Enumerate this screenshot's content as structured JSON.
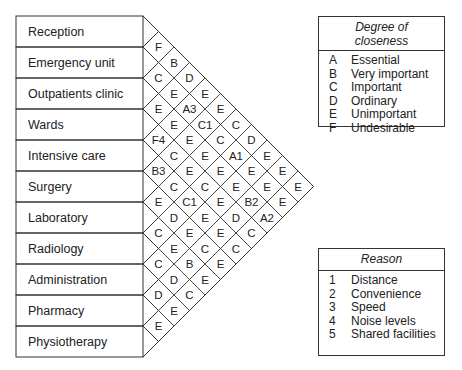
{
  "departments": [
    "Reception",
    "Emergency unit",
    "Outpatients clinic",
    "Wards",
    "Intensive care",
    "Surgery",
    "Laboratory",
    "Radiology",
    "Administration",
    "Pharmacy",
    "Physiotherapy"
  ],
  "matrix": [
    [
      "F",
      "B",
      "D",
      "E",
      "E",
      "C",
      "D",
      "E",
      "E",
      "E"
    ],
    [
      "C",
      "E",
      "A3",
      "C1",
      "C",
      "A1",
      "E",
      "E",
      "E"
    ],
    [
      "E",
      "E",
      "E",
      "E",
      "E",
      "E",
      "B2",
      "A2"
    ],
    [
      "F4",
      "C",
      "E",
      "C",
      "E",
      "D",
      "C"
    ],
    [
      "B3",
      "C",
      "C1",
      "E",
      "E",
      "C"
    ],
    [
      "E",
      "D",
      "E",
      "C",
      "E"
    ],
    [
      "C",
      "E",
      "B",
      "E"
    ],
    [
      "C",
      "D",
      "C"
    ],
    [
      "D",
      "E"
    ],
    [
      "E"
    ]
  ],
  "closeness_legend": {
    "title": "Degree of closeness",
    "title_line1": "Degree of",
    "title_line2": "closeness",
    "items": [
      {
        "key": "A",
        "label": "Essential"
      },
      {
        "key": "B",
        "label": "Very important"
      },
      {
        "key": "C",
        "label": "Important"
      },
      {
        "key": "D",
        "label": "Ordinary"
      },
      {
        "key": "E",
        "label": "Unimportant"
      },
      {
        "key": "F",
        "label": "Undesirable"
      }
    ]
  },
  "reason_legend": {
    "title": "Reason",
    "items": [
      {
        "key": "1",
        "label": "Distance"
      },
      {
        "key": "2",
        "label": "Convenience"
      },
      {
        "key": "3",
        "label": "Speed"
      },
      {
        "key": "4",
        "label": "Noise levels"
      },
      {
        "key": "5",
        "label": "Shared facilities"
      }
    ]
  }
}
